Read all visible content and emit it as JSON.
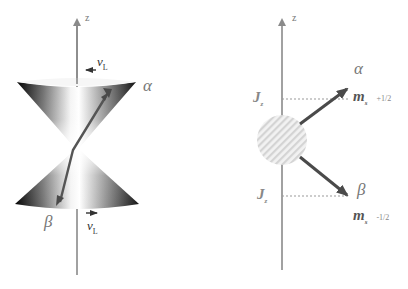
{
  "left_panel": {
    "axis_label": "z",
    "upper_cone_state": "α",
    "lower_cone_state": "β",
    "precession_label_top": "ν",
    "precession_label_top_sub": "L",
    "precession_label_bottom": "ν",
    "precession_label_bottom_sub": "L"
  },
  "right_panel": {
    "axis_label": "z",
    "upper_projection_label": "J",
    "upper_projection_sub": "z",
    "lower_projection_label": "J",
    "lower_projection_sub": "z",
    "upper_state": "α",
    "upper_ms_label": "m",
    "upper_ms_sub": "s",
    "upper_ms_value": "+1/2",
    "lower_state": "β",
    "lower_ms_label": "m",
    "lower_ms_sub": "s",
    "lower_ms_value": "-1/2"
  },
  "colors": {
    "axis": "#8a8a8a",
    "vector": "#555555",
    "label": "#777777",
    "nucleus_hatch": "#d8d8d8"
  }
}
